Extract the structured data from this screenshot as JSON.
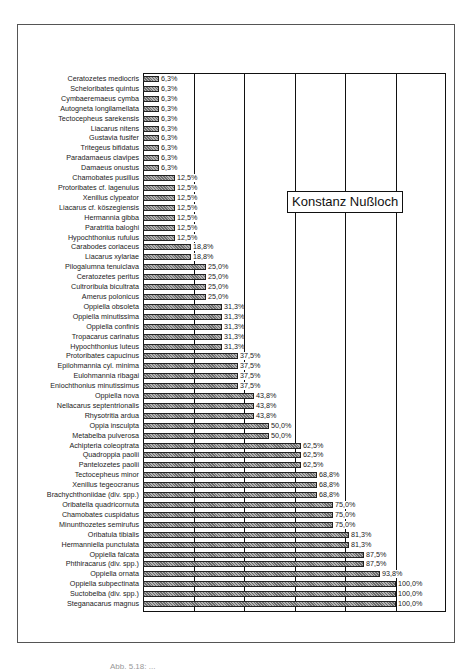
{
  "chart_data": {
    "type": "bar",
    "orientation": "horizontal",
    "title": "",
    "legend": [
      "Konstanz Nußloch"
    ],
    "legend_position": "upper-right inside plot",
    "xlabel": "",
    "ylabel": "",
    "xlim": [
      0,
      120
    ],
    "gridlines_x": [
      20,
      40,
      60,
      80,
      100
    ],
    "grid": true,
    "value_format": "percent with comma decimal",
    "categories": [
      "Ceratozetes mediocris",
      "Scheloribates quintus",
      "Cymbaeremaeus cymba",
      "Autogneta longilamellata",
      "Tectocepheus sarekensis",
      "Liacarus nitens",
      "Gustavia fusifer",
      "Tritegeus bifidatus",
      "Paradamaeus clavipes",
      "Damaeus onustus",
      "Chamobates pusillus",
      "Protoribates cf. lagenulus",
      "Xenillus clypeator",
      "Liacarus cf. köszegiensis",
      "Hermannia gibba",
      "Paratritia baloghi",
      "Hypochthonius rufulus",
      "Carabodes coriaceus",
      "Liacarus xylariae",
      "Pilogalumna tenuiclava",
      "Ceratozetes peritus",
      "Cultroribula bicultrata",
      "Amerus polonicus",
      "Oppiella obsoleta",
      "Oppiella minutissima",
      "Oppiella confinis",
      "Tropacarus carinatus",
      "Hypochthonius luteus",
      "Protoribates capucinus",
      "Epilohmannia cyl. minima",
      "Eulohmannia ribagai",
      "Eniochthonius minutissimus",
      "Oppiella nova",
      "Nellacarus septentrionalis",
      "Rhysotritia ardua",
      "Oppia insculpta",
      "Metabelba pulverosa",
      "Achipteria coleoptrata",
      "Quadroppia paolii",
      "Pantelozetes paolii",
      "Tectocepheus minor",
      "Xenillus tegeocranus",
      "Brachychthoniidae (div. spp.)",
      "Oribatella quadricornuta",
      "Chamobates cuspidatus",
      "Minunthozetes semirufus",
      "Oribatula tibialis",
      "Hermanniella punctulata",
      "Oppiella falcata",
      "Phthiracarus (div. spp.)",
      "Oppiella ornata",
      "Oppiella subpectinata",
      "Suctobelba (div. spp.)",
      "Steganacarus magnus"
    ],
    "values": [
      6.3,
      6.3,
      6.3,
      6.3,
      6.3,
      6.3,
      6.3,
      6.3,
      6.3,
      6.3,
      12.5,
      12.5,
      12.5,
      12.5,
      12.5,
      12.5,
      12.5,
      18.8,
      18.8,
      25.0,
      25.0,
      25.0,
      25.0,
      31.3,
      31.3,
      31.3,
      31.3,
      31.3,
      37.5,
      37.5,
      37.5,
      37.5,
      43.8,
      43.8,
      43.8,
      50.0,
      50.0,
      62.5,
      62.5,
      62.5,
      68.8,
      68.8,
      68.8,
      75.0,
      75.0,
      75.0,
      81.3,
      81.3,
      87.5,
      87.5,
      93.8,
      100.0,
      100.0,
      100.0
    ],
    "labels": [
      "6,3%",
      "6,3%",
      "6,3%",
      "6,3%",
      "6,3%",
      "6,3%",
      "6,3%",
      "6,3%",
      "6,3%",
      "6,3%",
      "12,5%",
      "12,5%",
      "12,5%",
      "12,5%",
      "12,5%",
      "12,5%",
      "12,5%",
      "18,8%",
      "18,8%",
      "25,0%",
      "25,0%",
      "25,0%",
      "25,0%",
      "31,3%",
      "31,3%",
      "31,3%",
      "31,3%",
      "31,3%",
      "37,5%",
      "37,5%",
      "37,5%",
      "37,5%",
      "43,8%",
      "43,8%",
      "43,8%",
      "50,0%",
      "50,0%",
      "62,5%",
      "62,5%",
      "62,5%",
      "68,8%",
      "68,8%",
      "68,8%",
      "75,0%",
      "75,0%",
      "75,0%",
      "81,3%",
      "81,3%",
      "87,5%",
      "87,5%",
      "93,8%",
      "100,0%",
      "100,0%",
      "100,0%"
    ]
  },
  "legend": {
    "label": "Konstanz Nußloch"
  },
  "caption": {
    "text": "Abb. 5.18: ..."
  }
}
